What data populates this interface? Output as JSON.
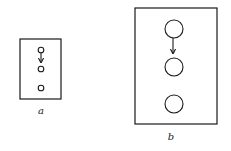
{
  "figure": {
    "panels": [
      {
        "id": "a",
        "label": "a",
        "frame": {
          "x": 20,
          "y": 39,
          "w": 41,
          "h": 60
        },
        "circles": [
          {
            "cx": 41,
            "cy": 50,
            "r": 2.8
          },
          {
            "cx": 41,
            "cy": 69,
            "r": 2.8
          },
          {
            "cx": 41,
            "cy": 88,
            "r": 2.8
          }
        ],
        "arrow": {
          "x": 41,
          "y1": 53,
          "y2": 62
        },
        "label_pos": {
          "x": 41,
          "y": 114
        }
      },
      {
        "id": "b",
        "label": "b",
        "frame": {
          "x": 135,
          "y": 8,
          "w": 82,
          "h": 116
        },
        "circles": [
          {
            "cx": 174,
            "cy": 29,
            "r": 9
          },
          {
            "cx": 174,
            "cy": 67,
            "r": 9
          },
          {
            "cx": 174,
            "cy": 104,
            "r": 9
          }
        ],
        "arrow": {
          "x": 173,
          "y1": 38,
          "y2": 53
        },
        "label_pos": {
          "x": 171,
          "y": 140
        }
      }
    ],
    "colors": {
      "stroke": "#1a1a1a",
      "background": "#ffffff"
    }
  }
}
